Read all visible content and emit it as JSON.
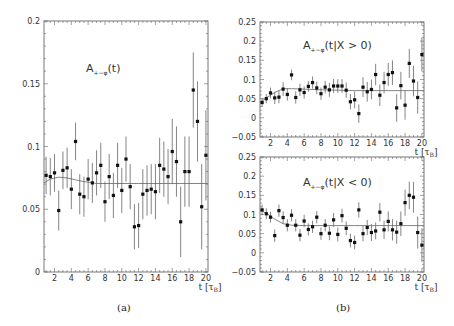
{
  "figure": {
    "panels": [
      "(a)",
      "(b)"
    ],
    "xlabel": "t [τ",
    "xlabel_sub": "B",
    "xlabel_close": "]"
  },
  "chart_data": [
    {
      "id": "a",
      "type": "scatter",
      "title": "A",
      "title_sub": "+−φ",
      "title_arg": "(t)",
      "xlabel": "t [τB]",
      "ylabel": "",
      "xlim": [
        0.75,
        20.25
      ],
      "ylim": [
        0,
        0.2
      ],
      "xticks": [
        2,
        4,
        6,
        8,
        10,
        12,
        14,
        16,
        18,
        20
      ],
      "yticks": [
        0,
        0.05,
        0.1,
        0.15,
        0.2
      ],
      "ytick_labels": [
        "0",
        "0.05",
        "0.1",
        "0.15",
        "0.2"
      ],
      "grid": false,
      "series": [
        {
          "name": "data",
          "x": [
            1.0,
            1.5,
            2.0,
            2.5,
            3.0,
            3.5,
            4.0,
            4.5,
            5.0,
            5.5,
            6.0,
            6.5,
            7.0,
            7.5,
            8.0,
            8.5,
            9.0,
            9.5,
            10.0,
            10.5,
            11.0,
            11.5,
            12.0,
            12.5,
            13.0,
            13.5,
            14.0,
            14.5,
            15.0,
            15.5,
            16.0,
            16.5,
            17.0,
            17.5,
            18.0,
            18.5,
            19.0,
            19.5,
            20.0
          ],
          "y": [
            0.077,
            0.076,
            0.079,
            0.049,
            0.081,
            0.083,
            0.066,
            0.104,
            0.062,
            0.06,
            0.074,
            0.071,
            0.079,
            0.085,
            0.056,
            0.076,
            0.061,
            0.085,
            0.065,
            0.09,
            0.068,
            0.036,
            0.037,
            0.062,
            0.065,
            0.066,
            0.064,
            0.085,
            0.082,
            0.076,
            0.096,
            0.088,
            0.04,
            0.08,
            0.08,
            0.145,
            0.12,
            0.052,
            0.093
          ],
          "err": [
            0.015,
            0.015,
            0.015,
            0.016,
            0.015,
            0.016,
            0.016,
            0.015,
            0.016,
            0.016,
            0.016,
            0.016,
            0.018,
            0.018,
            0.016,
            0.018,
            0.018,
            0.018,
            0.018,
            0.018,
            0.018,
            0.018,
            0.018,
            0.02,
            0.02,
            0.02,
            0.022,
            0.022,
            0.022,
            0.022,
            0.026,
            0.028,
            0.028,
            0.028,
            0.028,
            0.03,
            0.032,
            0.034,
            0.036
          ]
        },
        {
          "name": "fit",
          "x": [
            0.75,
            1.5,
            2.5,
            3.5,
            4.5,
            5.5,
            7,
            9,
            12,
            16,
            20.25
          ],
          "y": [
            0.071,
            0.074,
            0.0755,
            0.075,
            0.0735,
            0.072,
            0.0705,
            0.0705,
            0.0705,
            0.0705,
            0.0705
          ]
        }
      ]
    },
    {
      "id": "b_top",
      "type": "scatter",
      "title": "A",
      "title_sub": "+−φ",
      "title_arg": "(t|X > 0)",
      "xlabel": "t [τB]",
      "ylabel": "",
      "xlim": [
        0.75,
        20.25
      ],
      "ylim": [
        -0.05,
        0.25
      ],
      "xticks": [
        2,
        4,
        6,
        8,
        10,
        12,
        14,
        16,
        18,
        20
      ],
      "yticks": [
        -0.05,
        0,
        0.05,
        0.1,
        0.15,
        0.2,
        0.25
      ],
      "ytick_labels": [
        "−0.05",
        "0",
        "0.05",
        "0.1",
        "0.15",
        "0.2",
        "0.25"
      ],
      "grid": false,
      "series": [
        {
          "name": "data",
          "x": [
            1.0,
            1.5,
            2.0,
            2.5,
            3.0,
            3.5,
            4.0,
            4.5,
            5.0,
            5.5,
            6.0,
            6.5,
            7.0,
            7.5,
            8.0,
            8.5,
            9.0,
            9.5,
            10.0,
            10.5,
            11.0,
            11.5,
            12.0,
            12.5,
            13.0,
            13.5,
            14.0,
            14.5,
            15.0,
            15.5,
            16.0,
            16.5,
            17.0,
            17.5,
            18.0,
            18.5,
            19.0,
            19.5,
            20.0
          ],
          "y": [
            0.04,
            0.05,
            0.065,
            0.052,
            0.054,
            0.075,
            0.061,
            0.112,
            0.053,
            0.073,
            0.066,
            0.082,
            0.092,
            0.078,
            0.063,
            0.08,
            0.073,
            0.083,
            0.083,
            0.083,
            0.072,
            0.042,
            0.047,
            0.011,
            0.08,
            0.068,
            0.074,
            0.113,
            0.059,
            0.092,
            0.113,
            0.118,
            0.026,
            0.084,
            0.033,
            0.142,
            0.096,
            0.053,
            0.165
          ],
          "err": [
            0.012,
            0.012,
            0.014,
            0.016,
            0.016,
            0.018,
            0.016,
            0.014,
            0.016,
            0.016,
            0.016,
            0.014,
            0.016,
            0.016,
            0.016,
            0.016,
            0.018,
            0.018,
            0.018,
            0.018,
            0.02,
            0.02,
            0.022,
            0.024,
            0.026,
            0.026,
            0.026,
            0.028,
            0.028,
            0.028,
            0.03,
            0.032,
            0.036,
            0.036,
            0.038,
            0.038,
            0.04,
            0.042,
            0.044
          ]
        },
        {
          "name": "fit",
          "x": [
            0.75,
            1.5,
            2.5,
            3.5,
            4.5,
            6,
            8,
            12,
            16,
            20.25
          ],
          "y": [
            0.04,
            0.052,
            0.066,
            0.076,
            0.076,
            0.075,
            0.073,
            0.071,
            0.071,
            0.071
          ]
        }
      ]
    },
    {
      "id": "b_bottom",
      "type": "scatter",
      "title": "A",
      "title_sub": "+−φ",
      "title_arg": "(t|X < 0)",
      "xlabel": "t [τB]",
      "ylabel": "",
      "xlim": [
        0.75,
        20.25
      ],
      "ylim": [
        -0.05,
        0.25
      ],
      "xticks": [
        2,
        4,
        6,
        8,
        10,
        12,
        14,
        16,
        18,
        20
      ],
      "yticks": [
        -0.05,
        0,
        0.05,
        0.1,
        0.15,
        0.2,
        0.25
      ],
      "ytick_labels": [
        "−0.05",
        "0",
        "0.05",
        "0.1",
        "0.15",
        "0.2",
        "0.25"
      ],
      "grid": false,
      "series": [
        {
          "name": "data",
          "x": [
            1.0,
            1.5,
            2.0,
            2.5,
            3.0,
            3.5,
            4.0,
            4.5,
            5.0,
            5.5,
            6.0,
            6.5,
            7.0,
            7.5,
            8.0,
            8.5,
            9.0,
            9.5,
            10.0,
            10.5,
            11.0,
            11.5,
            12.0,
            12.5,
            13.0,
            13.5,
            14.0,
            14.5,
            15.0,
            15.5,
            16.0,
            16.5,
            17.0,
            17.5,
            18.0,
            18.5,
            19.0,
            19.5,
            20.0
          ],
          "y": [
            0.112,
            0.102,
            0.093,
            0.045,
            0.11,
            0.092,
            0.072,
            0.098,
            0.072,
            0.046,
            0.083,
            0.061,
            0.068,
            0.093,
            0.05,
            0.072,
            0.051,
            0.086,
            0.048,
            0.097,
            0.064,
            0.032,
            0.027,
            0.112,
            0.05,
            0.066,
            0.053,
            0.057,
            0.106,
            0.06,
            0.082,
            0.06,
            0.054,
            0.076,
            0.131,
            0.15,
            0.145,
            0.053,
            0.02
          ],
          "err": [
            0.014,
            0.014,
            0.014,
            0.016,
            0.016,
            0.016,
            0.016,
            0.016,
            0.016,
            0.016,
            0.016,
            0.016,
            0.016,
            0.016,
            0.016,
            0.016,
            0.018,
            0.018,
            0.018,
            0.018,
            0.018,
            0.018,
            0.018,
            0.02,
            0.02,
            0.02,
            0.022,
            0.022,
            0.024,
            0.024,
            0.026,
            0.028,
            0.03,
            0.032,
            0.034,
            0.036,
            0.04,
            0.042,
            0.044
          ]
        },
        {
          "name": "fit",
          "x": [
            0.75,
            1.5,
            2.5,
            3.5,
            4.5,
            6,
            8,
            12,
            16,
            20.25
          ],
          "y": [
            0.112,
            0.103,
            0.088,
            0.076,
            0.072,
            0.071,
            0.071,
            0.071,
            0.071,
            0.071
          ]
        }
      ]
    }
  ]
}
